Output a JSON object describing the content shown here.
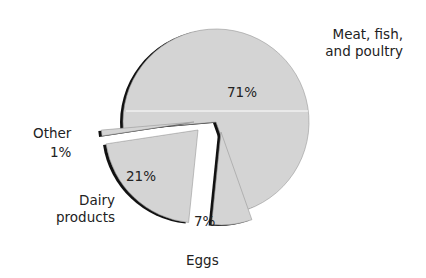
{
  "chart_data": {
    "type": "pie",
    "title": "",
    "categories": [
      "Meat, fish, and poultry",
      "Eggs",
      "Dairy products",
      "Other"
    ],
    "values": [
      71,
      7,
      21,
      1
    ],
    "value_labels": [
      "71%",
      "7%",
      "21%",
      "1%"
    ],
    "exploded": true,
    "legend": "none (direct labels)"
  },
  "labels": {
    "meat_line1": "Meat, fish,",
    "meat_line2": "and poultry",
    "meat_pct": "71%",
    "eggs": "Eggs",
    "eggs_pct": "7%",
    "dairy_line1": "Dairy",
    "dairy_line2": "products",
    "dairy_pct": "21%",
    "other": "Other",
    "other_pct": "1%"
  },
  "colors": {
    "fill": "#d4d4d4",
    "shadow": "#111111",
    "text": "#222222"
  }
}
